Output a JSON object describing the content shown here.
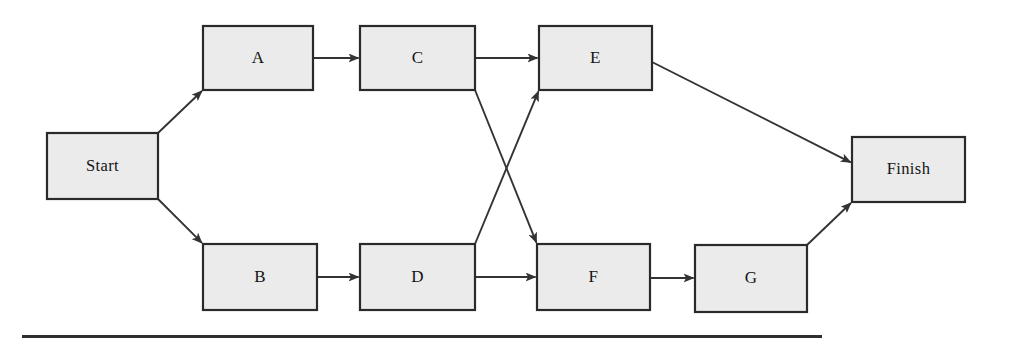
{
  "diagram": {
    "type": "flowchart",
    "colors": {
      "node_fill": "#ebebeb",
      "node_stroke": "#2a2a2a",
      "edge_stroke": "#333333",
      "label_text": "#141414",
      "background": "#ffffff",
      "rule": "#2f2f2f"
    },
    "nodes": [
      {
        "id": "start",
        "label": "Start",
        "x": 47,
        "y": 133,
        "w": 111,
        "h": 66
      },
      {
        "id": "a",
        "label": "A",
        "x": 203,
        "y": 26,
        "w": 110,
        "h": 64
      },
      {
        "id": "c",
        "label": "C",
        "x": 360,
        "y": 26,
        "w": 115,
        "h": 64
      },
      {
        "id": "e",
        "label": "E",
        "x": 539,
        "y": 26,
        "w": 113,
        "h": 64
      },
      {
        "id": "b",
        "label": "B",
        "x": 203,
        "y": 244,
        "w": 114,
        "h": 66
      },
      {
        "id": "d",
        "label": "D",
        "x": 360,
        "y": 244,
        "w": 115,
        "h": 66
      },
      {
        "id": "f",
        "label": "F",
        "x": 537,
        "y": 244,
        "w": 113,
        "h": 66
      },
      {
        "id": "g",
        "label": "G",
        "x": 695,
        "y": 245,
        "w": 112,
        "h": 67
      },
      {
        "id": "finish",
        "label": "Finish",
        "x": 852,
        "y": 137,
        "w": 113,
        "h": 65
      }
    ],
    "edges": [
      {
        "id": "start-a",
        "from": "Start",
        "to": "A",
        "x1": 158,
        "y1": 133,
        "x2": 203,
        "y2": 90
      },
      {
        "id": "start-b",
        "from": "Start",
        "to": "B",
        "x1": 158,
        "y1": 199,
        "x2": 203,
        "y2": 244
      },
      {
        "id": "a-c",
        "from": "A",
        "to": "C",
        "x1": 313,
        "y1": 58,
        "x2": 360,
        "y2": 58
      },
      {
        "id": "c-e",
        "from": "C",
        "to": "E",
        "x1": 475,
        "y1": 58,
        "x2": 539,
        "y2": 58
      },
      {
        "id": "c-f",
        "from": "C",
        "to": "F",
        "x1": 475,
        "y1": 90,
        "x2": 537,
        "y2": 244
      },
      {
        "id": "d-e",
        "from": "D",
        "to": "E",
        "x1": 475,
        "y1": 244,
        "x2": 539,
        "y2": 90
      },
      {
        "id": "b-d",
        "from": "B",
        "to": "D",
        "x1": 317,
        "y1": 277,
        "x2": 360,
        "y2": 277
      },
      {
        "id": "d-f",
        "from": "D",
        "to": "F",
        "x1": 475,
        "y1": 277,
        "x2": 537,
        "y2": 277
      },
      {
        "id": "f-g",
        "from": "F",
        "to": "G",
        "x1": 650,
        "y1": 278,
        "x2": 695,
        "y2": 278
      },
      {
        "id": "e-finish",
        "from": "E",
        "to": "Finish",
        "x1": 652,
        "y1": 62,
        "x2": 852,
        "y2": 163
      },
      {
        "id": "g-finish",
        "from": "G",
        "to": "Finish",
        "x1": 807,
        "y1": 245,
        "x2": 852,
        "y2": 202
      }
    ],
    "rule": {
      "x": 22,
      "y": 335,
      "w": 800,
      "h": 3
    }
  }
}
